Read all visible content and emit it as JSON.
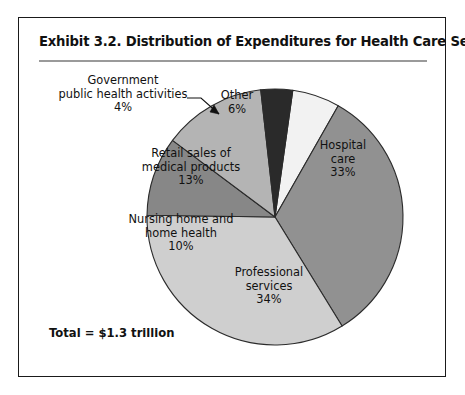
{
  "figure": {
    "title": "Exhibit 3.2.  Distribution of Expenditures for Health Care Services",
    "total_note": "Total = $1.3 trillion"
  },
  "labels": {
    "government": "Government\npublic health activities\n4%",
    "other": "Other\n6%",
    "hospital": "Hospital\ncare\n33%",
    "professional": "Professional\nservices\n34%",
    "nursing": "Nursing home and\nhome health\n10%",
    "retail": "Retail sales of\nmedical products\n13%"
  },
  "chart_data": {
    "type": "pie",
    "title": "Exhibit 3.2.  Distribution of Expenditures for Health Care Services",
    "unit": "percent",
    "total_label": "Total = $1.3 trillion",
    "total_value": 1.3,
    "total_unit": "trillion USD",
    "legend": "none",
    "grid": false,
    "start_angle_deg": 8,
    "direction": "clockwise",
    "categories": [
      "Other",
      "Hospital care",
      "Professional services",
      "Nursing home and home health",
      "Retail sales of medical products",
      "Government public health activities"
    ],
    "values": [
      6,
      33,
      34,
      10,
      13,
      4
    ],
    "colors": [
      "#f2f2f2",
      "#919191",
      "#cfcfcf",
      "#878787",
      "#b4b4b4",
      "#2a2a2a"
    ],
    "slices": [
      {
        "label": "Other",
        "value": 6,
        "color": "#f2f2f2",
        "label_text": "Other\n6%"
      },
      {
        "label": "Hospital care",
        "value": 33,
        "color": "#919191",
        "label_text": "Hospital\ncare\n33%"
      },
      {
        "label": "Professional services",
        "value": 34,
        "color": "#cfcfcf",
        "label_text": "Professional\nservices\n34%"
      },
      {
        "label": "Nursing home and home health",
        "value": 10,
        "color": "#878787",
        "label_text": "Nursing home and\nhome health\n10%"
      },
      {
        "label": "Retail sales of medical products",
        "value": 13,
        "color": "#b4b4b4",
        "label_text": "Retail sales of\nmedical products\n13%"
      },
      {
        "label": "Government public health activities",
        "value": 4,
        "color": "#2a2a2a",
        "label_text": "Government\npublic health activities\n4%"
      }
    ]
  },
  "style": {
    "outline": "#1a1a1a",
    "rule": "#9a9a9a",
    "text": "#111111"
  }
}
